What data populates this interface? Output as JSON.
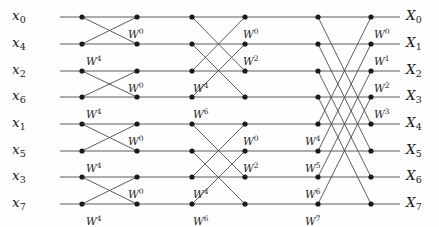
{
  "figure": {
    "type": "signal-flow-graph",
    "name": "8-point radix-2 decimation-in-time FFT butterfly diagram",
    "width": 439,
    "height": 227,
    "background_color": "#fefefe",
    "line_color": "#4a4a4a",
    "node_color": "#1a1a1a",
    "text_color": "#1a1a1a",
    "stages": 3,
    "node_columns": 6,
    "rows": 8
  },
  "geometry": {
    "row_y": [
      17,
      44,
      71,
      97,
      124,
      151,
      177,
      204
    ],
    "node_x": [
      82,
      137,
      192,
      245,
      318,
      371
    ],
    "input_line_x": 60,
    "output_line_x": 400,
    "node_radius": 2.6,
    "line_width": 0.9
  },
  "inputs": [
    {
      "base": "x",
      "sub": "0",
      "row": 0
    },
    {
      "base": "x",
      "sub": "4",
      "row": 1
    },
    {
      "base": "x",
      "sub": "2",
      "row": 2
    },
    {
      "base": "x",
      "sub": "6",
      "row": 3
    },
    {
      "base": "x",
      "sub": "1",
      "row": 4
    },
    {
      "base": "x",
      "sub": "5",
      "row": 5
    },
    {
      "base": "x",
      "sub": "3",
      "row": 6
    },
    {
      "base": "x",
      "sub": "7",
      "row": 7
    }
  ],
  "outputs": [
    {
      "base": "X",
      "sub": "0",
      "row": 0
    },
    {
      "base": "X",
      "sub": "1",
      "row": 1
    },
    {
      "base": "X",
      "sub": "2",
      "row": 2
    },
    {
      "base": "X",
      "sub": "3",
      "row": 3
    },
    {
      "base": "X",
      "sub": "4",
      "row": 4
    },
    {
      "base": "X",
      "sub": "5",
      "row": 5
    },
    {
      "base": "X",
      "sub": "6",
      "row": 6
    },
    {
      "base": "X",
      "sub": "7",
      "row": 7
    }
  ],
  "butterflies": [
    {
      "stage": 1,
      "from_col": 0,
      "to_col": 1,
      "top_row": 0,
      "bottom_row": 1
    },
    {
      "stage": 1,
      "from_col": 0,
      "to_col": 1,
      "top_row": 2,
      "bottom_row": 3
    },
    {
      "stage": 1,
      "from_col": 0,
      "to_col": 1,
      "top_row": 4,
      "bottom_row": 5
    },
    {
      "stage": 1,
      "from_col": 0,
      "to_col": 1,
      "top_row": 6,
      "bottom_row": 7
    },
    {
      "stage": 2,
      "from_col": 2,
      "to_col": 3,
      "top_row": 0,
      "bottom_row": 2
    },
    {
      "stage": 2,
      "from_col": 2,
      "to_col": 3,
      "top_row": 1,
      "bottom_row": 3
    },
    {
      "stage": 2,
      "from_col": 2,
      "to_col": 3,
      "top_row": 4,
      "bottom_row": 6
    },
    {
      "stage": 2,
      "from_col": 2,
      "to_col": 3,
      "top_row": 5,
      "bottom_row": 7
    },
    {
      "stage": 3,
      "from_col": 4,
      "to_col": 5,
      "top_row": 0,
      "bottom_row": 4
    },
    {
      "stage": 3,
      "from_col": 4,
      "to_col": 5,
      "top_row": 1,
      "bottom_row": 5
    },
    {
      "stage": 3,
      "from_col": 4,
      "to_col": 5,
      "top_row": 2,
      "bottom_row": 6
    },
    {
      "stage": 3,
      "from_col": 4,
      "to_col": 5,
      "top_row": 3,
      "bottom_row": 7
    }
  ],
  "twiddle_labels": [
    {
      "id": "s1-b1-w0",
      "base": "W",
      "exp": "0",
      "x": 128,
      "y": 28,
      "stage": 1
    },
    {
      "id": "s1-b1-w4",
      "base": "W",
      "exp": "4",
      "x": 86,
      "y": 55,
      "stage": 1
    },
    {
      "id": "s1-b2-w0",
      "base": "W",
      "exp": "0",
      "x": 128,
      "y": 82,
      "stage": 1
    },
    {
      "id": "s1-b2-w4",
      "base": "W",
      "exp": "4",
      "x": 86,
      "y": 108,
      "stage": 1
    },
    {
      "id": "s1-b3-w0",
      "base": "W",
      "exp": "0",
      "x": 128,
      "y": 135,
      "stage": 1
    },
    {
      "id": "s1-b3-w4",
      "base": "W",
      "exp": "4",
      "x": 86,
      "y": 162,
      "stage": 1
    },
    {
      "id": "s1-b4-w0",
      "base": "W",
      "exp": "0",
      "x": 128,
      "y": 188,
      "stage": 1
    },
    {
      "id": "s1-b4-w4",
      "base": "W",
      "exp": "4",
      "x": 86,
      "y": 215,
      "stage": 1
    },
    {
      "id": "s2-g1-w0",
      "base": "W",
      "exp": "0",
      "x": 243,
      "y": 28,
      "stage": 2
    },
    {
      "id": "s2-g1-w2",
      "base": "W",
      "exp": "2",
      "x": 243,
      "y": 55,
      "stage": 2
    },
    {
      "id": "s2-g1-w4",
      "base": "W",
      "exp": "4",
      "x": 193,
      "y": 82,
      "stage": 2
    },
    {
      "id": "s2-g1-w6",
      "base": "W",
      "exp": "6",
      "x": 193,
      "y": 108,
      "stage": 2
    },
    {
      "id": "s2-g2-w0",
      "base": "W",
      "exp": "0",
      "x": 243,
      "y": 135,
      "stage": 2
    },
    {
      "id": "s2-g2-w2",
      "base": "W",
      "exp": "2",
      "x": 243,
      "y": 162,
      "stage": 2
    },
    {
      "id": "s2-g2-w4",
      "base": "W",
      "exp": "4",
      "x": 193,
      "y": 188,
      "stage": 2
    },
    {
      "id": "s2-g2-w6",
      "base": "W",
      "exp": "6",
      "x": 193,
      "y": 215,
      "stage": 2
    },
    {
      "id": "s3-w0",
      "base": "W",
      "exp": "0",
      "x": 374,
      "y": 28,
      "stage": 3
    },
    {
      "id": "s3-w1",
      "base": "W",
      "exp": "1",
      "x": 374,
      "y": 55,
      "stage": 3
    },
    {
      "id": "s3-w2",
      "base": "W",
      "exp": "2",
      "x": 374,
      "y": 82,
      "stage": 3
    },
    {
      "id": "s3-w3",
      "base": "W",
      "exp": "3",
      "x": 374,
      "y": 108,
      "stage": 3
    },
    {
      "id": "s3-w4",
      "base": "W",
      "exp": "4",
      "x": 305,
      "y": 135,
      "stage": 3
    },
    {
      "id": "s3-w5",
      "base": "W",
      "exp": "5",
      "x": 305,
      "y": 162,
      "stage": 3
    },
    {
      "id": "s3-w6",
      "base": "W",
      "exp": "6",
      "x": 305,
      "y": 188,
      "stage": 3
    },
    {
      "id": "s3-w7",
      "base": "W",
      "exp": "7",
      "x": 305,
      "y": 215,
      "stage": 3
    }
  ]
}
